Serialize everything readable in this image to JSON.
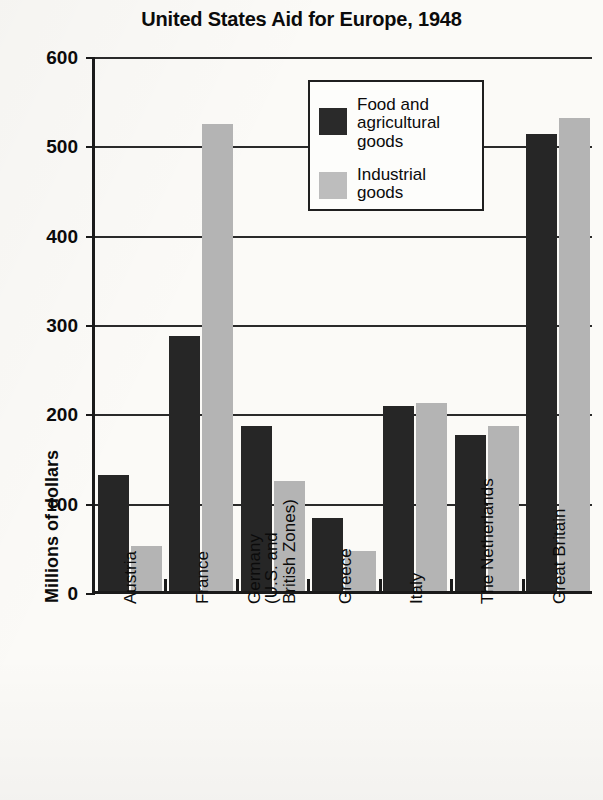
{
  "chart_data": {
    "type": "bar",
    "title": "United States Aid for Europe, 1948",
    "xlabel": "",
    "ylabel": "Millions of dollars",
    "ylim": [
      0,
      600
    ],
    "ytick_labels": [
      "600",
      "500",
      "400",
      "300",
      "200",
      "100",
      "0"
    ],
    "ytick_values": [
      600,
      500,
      400,
      300,
      200,
      100,
      0
    ],
    "grid": true,
    "legend_position": "upper-center",
    "categories": [
      "Austria",
      "France",
      "Germany (U.S. and British Zones)",
      "Greece",
      "Italy",
      "The Netherlands",
      "Great Britain"
    ],
    "category_label_lines": [
      [
        "Austria"
      ],
      [
        "France"
      ],
      [
        "Germany",
        "(U.S. and",
        "British Zones)"
      ],
      [
        "Greece"
      ],
      [
        "Italy"
      ],
      [
        "The Netherlands"
      ],
      [
        "Great Britain"
      ]
    ],
    "series": [
      {
        "name": "Food and agricultural goods",
        "legend_label_lines": [
          "Food and",
          "agricultural",
          "goods"
        ],
        "color": "#262626",
        "values": [
          130,
          285,
          185,
          82,
          207,
          175,
          512
        ]
      },
      {
        "name": "Industrial goods",
        "legend_label_lines": [
          "Industrial",
          "goods"
        ],
        "color": "#b4b4b4",
        "values": [
          50,
          523,
          123,
          45,
          210,
          185,
          530
        ]
      }
    ]
  },
  "legend": {
    "entry_1": "Food and\nagricultural\ngoods",
    "entry_2": "Industrial\ngoods"
  }
}
